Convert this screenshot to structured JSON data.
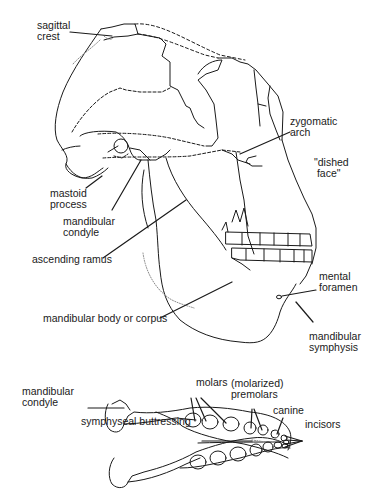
{
  "figure": {
    "views": [
      "lateral view of skull",
      "occlusal view of mandible"
    ]
  },
  "labels": {
    "sagittal_crest": "sagittal\ncrest",
    "zygomatic_arch": "zygomatic\narch",
    "dished_face": "\"dished\n face\"",
    "mastoid_process": "mastoid\nprocess",
    "mandibular_condyle_skull": "mandibular\ncondyle",
    "ascending_ramus": "ascending ramus",
    "mental_foramen": "mental\nforamen",
    "mandibular_body": "mandibular body or corpus",
    "mandibular_symphysis": "mandibular\nsymphysis",
    "mandibular_condyle_jaw": "mandibular\ncondyle",
    "molars": "molars",
    "molarized_premolars": "(molarized)\npremolars",
    "canine": "canine",
    "symphyseal_buttressing": "symphyseal buttressing",
    "incisors": "incisors"
  },
  "colors": {
    "line": "#1a1a1a",
    "stipple": "#8a8a8a",
    "background": "#ffffff"
  }
}
